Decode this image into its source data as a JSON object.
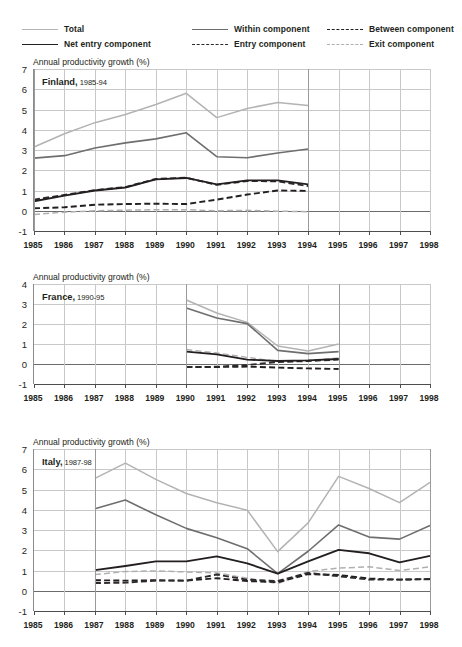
{
  "legend": {
    "items": [
      {
        "label": "Total",
        "style": "solid-light",
        "key": "total"
      },
      {
        "label": "Within component",
        "style": "solid-mid",
        "key": "within"
      },
      {
        "label": "Between component",
        "style": "dash-dark",
        "key": "between"
      },
      {
        "label": "Net entry component",
        "style": "solid-dark",
        "key": "net_entry"
      },
      {
        "label": "Entry component",
        "style": "dash-dark2",
        "key": "entry"
      },
      {
        "label": "Exit component",
        "style": "dash-light",
        "key": "exit"
      }
    ]
  },
  "axis_title": "Annual productivity growth (%)",
  "colors": {
    "total": "#b3b3b3",
    "within": "#6e6e6e",
    "between": "#231f20",
    "net_entry": "#231f20",
    "entry": "#2d2a2b",
    "exit": "#b0b0b0",
    "grid": "#c9c9c9",
    "axis": "#4d4d4d",
    "text": "#231f20"
  },
  "x_ticks": [
    1985,
    1986,
    1987,
    1988,
    1989,
    1990,
    1991,
    1992,
    1993,
    1994,
    1995,
    1996,
    1997,
    1998
  ],
  "chart_data": [
    {
      "type": "line",
      "panel": "finland",
      "title_country": "Finland,",
      "title_years": "1985-94",
      "title": "Finland, 1985-94",
      "ylabel": "Annual productivity growth (%)",
      "xlabel": "",
      "ylim": [
        -1,
        7
      ],
      "yticks": [
        -1,
        0,
        1,
        2,
        3,
        4,
        5,
        6,
        7
      ],
      "xlim": [
        1985,
        1998
      ],
      "grid": true,
      "legend_position": "top",
      "x": [
        1985,
        1986,
        1987,
        1988,
        1989,
        1990,
        1991,
        1992,
        1993,
        1994
      ],
      "series": [
        {
          "name": "Total",
          "key": "total",
          "values": [
            3.15,
            3.8,
            4.35,
            4.75,
            5.25,
            5.8,
            4.6,
            5.05,
            5.35,
            5.2
          ]
        },
        {
          "name": "Within component",
          "key": "within",
          "values": [
            2.6,
            2.72,
            3.1,
            3.35,
            3.55,
            3.85,
            2.67,
            2.62,
            2.85,
            3.05
          ]
        },
        {
          "name": "Net entry component",
          "key": "net_entry",
          "values": [
            0.47,
            0.75,
            1.0,
            1.15,
            1.55,
            1.62,
            1.3,
            1.5,
            1.5,
            1.3
          ]
        },
        {
          "name": "Between component",
          "key": "between",
          "values": [
            0.12,
            0.17,
            0.3,
            0.33,
            0.35,
            0.33,
            0.55,
            0.8,
            1.0,
            0.98
          ]
        },
        {
          "name": "Entry component",
          "key": "entry",
          "values": [
            0.55,
            0.78,
            1.02,
            1.17,
            1.57,
            1.63,
            1.28,
            1.47,
            1.45,
            1.22
          ]
        },
        {
          "name": "Exit component",
          "key": "exit",
          "values": [
            -0.18,
            -0.07,
            0.0,
            0.03,
            0.05,
            0.05,
            0.0,
            0.02,
            -0.02,
            -0.05
          ]
        }
      ]
    },
    {
      "type": "line",
      "panel": "france",
      "title_country": "France,",
      "title_years": "1990-95",
      "title": "France, 1990-95",
      "ylabel": "Annual productivity growth (%)",
      "xlabel": "",
      "ylim": [
        -1,
        4
      ],
      "yticks": [
        -1,
        0,
        1,
        2,
        3,
        4
      ],
      "xlim": [
        1985,
        1998
      ],
      "grid": true,
      "legend_position": "top",
      "x": [
        1990,
        1991,
        1992,
        1993,
        1994,
        1995
      ],
      "series": [
        {
          "name": "Total",
          "key": "total",
          "values": [
            3.2,
            2.55,
            2.08,
            0.9,
            0.65,
            1.0
          ]
        },
        {
          "name": "Within component",
          "key": "within",
          "values": [
            2.8,
            2.3,
            2.02,
            0.68,
            0.52,
            0.62
          ]
        },
        {
          "name": "Net entry component",
          "key": "net_entry",
          "values": [
            0.62,
            0.48,
            0.22,
            0.15,
            0.18,
            0.25
          ]
        },
        {
          "name": "Between component",
          "key": "between",
          "values": [
            -0.15,
            -0.15,
            -0.13,
            -0.18,
            -0.22,
            -0.25
          ]
        },
        {
          "name": "Entry component",
          "key": "entry",
          "values": [
            -0.15,
            -0.14,
            -0.05,
            0.1,
            0.15,
            0.22
          ]
        },
        {
          "name": "Exit component",
          "key": "exit",
          "values": [
            0.72,
            0.55,
            0.33,
            0.12,
            0.18,
            0.3
          ]
        }
      ]
    },
    {
      "type": "line",
      "panel": "italy",
      "title_country": "Italy,",
      "title_years": "1987-98",
      "title": "Italy, 1987-98",
      "ylabel": "Annual productivity growth (%)",
      "xlabel": "",
      "ylim": [
        -1,
        7
      ],
      "yticks": [
        -1,
        0,
        1,
        2,
        3,
        4,
        5,
        6,
        7
      ],
      "xlim": [
        1985,
        1998
      ],
      "grid": true,
      "legend_position": "top",
      "x": [
        1987,
        1988,
        1989,
        1990,
        1991,
        1992,
        1993,
        1994,
        1995,
        1996,
        1997,
        1998
      ],
      "series": [
        {
          "name": "Total",
          "key": "total",
          "values": [
            5.55,
            6.3,
            5.5,
            4.8,
            4.35,
            3.98,
            1.93,
            3.35,
            5.65,
            5.05,
            4.35,
            5.35
          ]
        },
        {
          "name": "Within component",
          "key": "within",
          "values": [
            4.05,
            4.48,
            3.75,
            3.08,
            2.62,
            2.08,
            0.85,
            1.95,
            3.25,
            2.65,
            2.55,
            3.22
          ]
        },
        {
          "name": "Net entry component",
          "key": "net_entry",
          "values": [
            1.02,
            1.22,
            1.45,
            1.45,
            1.7,
            1.35,
            0.85,
            1.45,
            2.02,
            1.85,
            1.4,
            1.72
          ]
        },
        {
          "name": "Between component",
          "key": "between",
          "values": [
            0.52,
            0.5,
            0.52,
            0.5,
            0.62,
            0.48,
            0.42,
            0.82,
            0.78,
            0.6,
            0.55,
            0.58
          ]
        },
        {
          "name": "Entry component",
          "key": "entry",
          "values": [
            0.38,
            0.4,
            0.5,
            0.5,
            0.8,
            0.55,
            0.48,
            0.88,
            0.72,
            0.55,
            0.55,
            0.57
          ]
        },
        {
          "name": "Exit component",
          "key": "exit",
          "values": [
            0.8,
            0.95,
            0.98,
            0.93,
            0.88,
            0.62,
            0.35,
            0.95,
            1.12,
            1.18,
            1.0,
            1.18
          ]
        }
      ]
    }
  ]
}
